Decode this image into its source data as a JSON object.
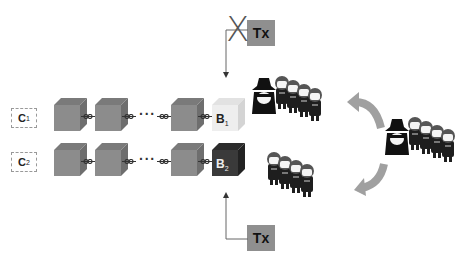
{
  "chains": [
    {
      "label": "C",
      "sub": "1",
      "head_block": {
        "label": "B",
        "sub": "1",
        "shade": "light"
      }
    },
    {
      "label": "C",
      "sub": "2",
      "head_block": {
        "label": "B",
        "sub": "2",
        "shade": "dark"
      }
    }
  ],
  "ellipsis": "···",
  "transactions": {
    "rejected": {
      "label": "Tx",
      "mark": "X"
    },
    "accepted": {
      "label": "Tx"
    }
  },
  "groups": [
    {
      "name": "attacker-group-top",
      "attacker": true,
      "members": 4
    },
    {
      "name": "honest-group-bottom",
      "attacker": false,
      "members": 4
    },
    {
      "name": "attacker-group-right",
      "attacker": true,
      "members": 4
    }
  ],
  "colors": {
    "block_gray": "#8c8c8c",
    "block_light": "#eeeeee",
    "block_dark": "#3a3a3a",
    "tx_box": "#8f8f8f",
    "arrow_gray": "#a0a0a0"
  }
}
